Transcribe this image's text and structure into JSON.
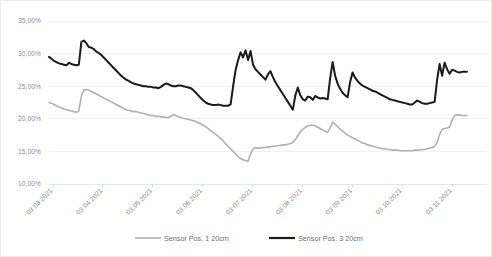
{
  "chart_data": {
    "type": "line",
    "title": "",
    "xlabel": "",
    "ylabel": "",
    "ylim": [
      10,
      35
    ],
    "ytick_values": [
      10,
      15,
      20,
      25,
      30,
      35
    ],
    "ytick_labels": [
      "10,00%",
      "15,00%",
      "20,00%",
      "25,00%",
      "30,00%",
      "35,00%"
    ],
    "xtick_labels": [
      "03.03.2021",
      "03.04.2021",
      "03.05.2021",
      "03.06.2021",
      "03.07.2021",
      "03.08.2021",
      "03.09.2021",
      "03.10.2021",
      "03.11.2021"
    ],
    "grid": "horizontal",
    "legend_position": "bottom",
    "series": [
      {
        "name": "Sensor Pos. 1 20cm",
        "color": "#b0b0b0",
        "width": 1.6,
        "values": [
          22.5,
          22.4,
          22.2,
          22.0,
          21.8,
          21.7,
          21.5,
          21.4,
          21.3,
          21.2,
          21.1,
          21.0,
          21.2,
          23.5,
          24.4,
          24.5,
          24.4,
          24.2,
          24.0,
          23.8,
          23.6,
          23.4,
          23.2,
          23.0,
          22.8,
          22.6,
          22.4,
          22.2,
          22.0,
          21.8,
          21.6,
          21.4,
          21.3,
          21.2,
          21.1,
          21.1,
          21.0,
          20.9,
          20.8,
          20.7,
          20.6,
          20.5,
          20.5,
          20.4,
          20.4,
          20.3,
          20.3,
          20.2,
          20.2,
          20.4,
          20.6,
          20.5,
          20.3,
          20.2,
          20.1,
          20.0,
          19.9,
          19.8,
          19.7,
          19.6,
          19.4,
          19.2,
          19.0,
          18.8,
          18.5,
          18.2,
          17.9,
          17.6,
          17.3,
          17.0,
          16.6,
          16.2,
          15.8,
          15.4,
          15.0,
          14.6,
          14.2,
          13.9,
          13.7,
          13.6,
          13.5,
          14.6,
          15.4,
          15.6,
          15.5,
          15.5,
          15.6,
          15.6,
          15.7,
          15.7,
          15.8,
          15.8,
          15.9,
          15.9,
          16.0,
          16.0,
          16.1,
          16.2,
          16.4,
          16.8,
          17.4,
          18.0,
          18.4,
          18.7,
          18.9,
          19.0,
          19.0,
          18.9,
          18.7,
          18.5,
          18.3,
          18.1,
          17.9,
          18.6,
          19.5,
          19.2,
          18.8,
          18.4,
          18.1,
          17.8,
          17.5,
          17.3,
          17.1,
          16.9,
          16.7,
          16.5,
          16.3,
          16.2,
          16.0,
          15.9,
          15.8,
          15.7,
          15.6,
          15.5,
          15.4,
          15.4,
          15.3,
          15.3,
          15.2,
          15.2,
          15.2,
          15.1,
          15.1,
          15.1,
          15.1,
          15.1,
          15.1,
          15.2,
          15.2,
          15.2,
          15.3,
          15.3,
          15.4,
          15.5,
          15.6,
          15.8,
          16.4,
          17.6,
          18.4,
          18.5,
          18.6,
          18.7,
          19.8,
          20.5,
          20.6,
          20.6,
          20.5,
          20.5,
          20.5
        ]
      },
      {
        "name": "Sensor Pos. 3 20cm",
        "color": "#1a1a1a",
        "width": 2.0,
        "values": [
          29.5,
          29.2,
          28.9,
          28.7,
          28.5,
          28.4,
          28.3,
          28.2,
          28.6,
          28.4,
          28.3,
          28.2,
          28.3,
          31.8,
          32.0,
          31.6,
          31.0,
          30.9,
          30.7,
          30.3,
          30.1,
          29.8,
          29.4,
          29.0,
          28.6,
          28.2,
          27.8,
          27.4,
          27.0,
          26.6,
          26.3,
          26.0,
          25.8,
          25.6,
          25.4,
          25.3,
          25.2,
          25.1,
          25.0,
          25.0,
          24.9,
          24.9,
          24.8,
          24.8,
          24.7,
          24.9,
          25.2,
          25.4,
          25.3,
          25.1,
          25.0,
          25.0,
          25.1,
          25.1,
          25.0,
          24.9,
          24.8,
          24.7,
          24.4,
          24.0,
          23.6,
          23.2,
          22.8,
          22.5,
          22.3,
          22.2,
          22.1,
          22.1,
          22.2,
          22.1,
          22.0,
          22.0,
          22.0,
          22.2,
          25.0,
          27.5,
          29.0,
          30.2,
          29.4,
          30.5,
          29.0,
          30.4,
          28.3,
          27.6,
          27.2,
          26.8,
          26.4,
          26.0,
          26.8,
          27.3,
          26.4,
          25.6,
          25.0,
          24.4,
          23.8,
          23.2,
          22.6,
          22.0,
          21.4,
          23.6,
          24.8,
          23.6,
          23.0,
          22.8,
          23.4,
          23.3,
          22.9,
          23.5,
          23.3,
          23.1,
          23.2,
          23.1,
          23.0,
          26.2,
          28.7,
          26.6,
          25.4,
          24.6,
          24.0,
          23.6,
          23.3,
          25.6,
          27.1,
          26.3,
          25.8,
          25.4,
          25.1,
          24.9,
          24.7,
          24.5,
          24.3,
          24.2,
          24.0,
          23.8,
          23.6,
          23.4,
          23.2,
          23.0,
          22.9,
          22.8,
          22.7,
          22.6,
          22.5,
          22.4,
          22.3,
          22.2,
          22.2,
          22.5,
          22.8,
          22.6,
          22.4,
          22.3,
          22.3,
          22.4,
          22.5,
          22.6,
          26.0,
          28.4,
          26.6,
          28.6,
          27.6,
          26.9,
          27.5,
          27.4,
          27.2,
          27.1,
          27.2,
          27.2,
          27.2
        ]
      }
    ]
  },
  "legend": {
    "items": [
      {
        "label": "Sensor Pos. 1 20cm",
        "color": "#b0b0b0"
      },
      {
        "label": "Sensor Pos. 3 20cm",
        "color": "#1a1a1a"
      }
    ]
  }
}
